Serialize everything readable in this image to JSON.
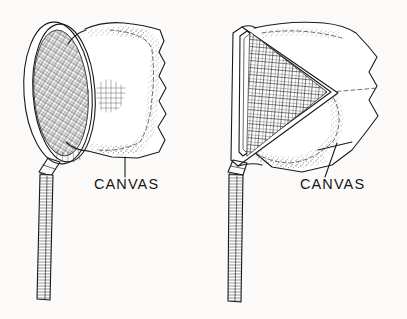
{
  "figure": {
    "background_color": "#fbfaf8",
    "ink_color": "#1a1a1a",
    "width": 407,
    "height": 319
  },
  "labels": {
    "left_canvas": "CANVAS",
    "right_canvas": "CANVAS"
  },
  "left_net": {
    "name": "round-hoop-net",
    "parts": {
      "hoop": "oval-hoop-rim",
      "mesh": "cross-hatched-mesh-panel",
      "canvas": "canvas-bag",
      "handle": "hatched-handle-shaft",
      "ferrule": "handle-collar"
    }
  },
  "right_net": {
    "name": "triangular-frame-net",
    "parts": {
      "frame": "triangular-frame",
      "mesh": "grid-mesh-panel",
      "canvas": "canvas-bag",
      "handle": "hatched-handle-shaft",
      "ferrule": "handle-collar"
    }
  },
  "leader_lines": {
    "left": "vertical-leader-line",
    "right": "diagonal-leader-line"
  }
}
